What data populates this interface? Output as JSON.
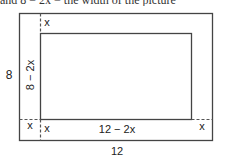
{
  "caption_fragment": "and 8 − 2x = the width of the picture",
  "diagram": {
    "outer": {
      "width_label": "12",
      "height_label": "8"
    },
    "inner": {
      "width_label": "12 − 2x",
      "height_label": "8 − 2x"
    },
    "border_labels": {
      "top": "x",
      "bottom_left_outer": "x",
      "bottom_left_inner": "x",
      "bottom_right": "x"
    },
    "colors": {
      "stroke": "#444444",
      "dashed": "#555555",
      "text": "#222222"
    }
  }
}
